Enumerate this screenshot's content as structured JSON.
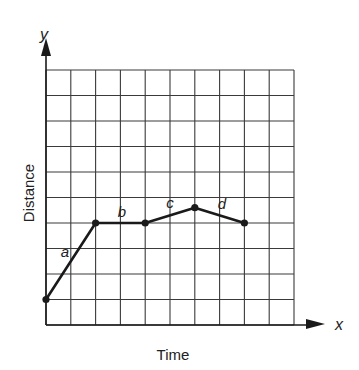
{
  "axes": {
    "x_symbol": "x",
    "y_symbol": "y",
    "x_label": "Time",
    "y_label": "Distance"
  },
  "grid": {
    "columns": 10,
    "rows": 10
  },
  "segment_labels": [
    "a",
    "b",
    "c",
    "d"
  ],
  "chart_data": {
    "type": "line",
    "title": "",
    "xlabel": "Time",
    "ylabel": "Distance",
    "grid": true,
    "xlim": [
      0,
      10
    ],
    "ylim": [
      0,
      10
    ],
    "tick_labels": "none",
    "x": [
      0,
      2,
      4,
      6,
      8
    ],
    "series": [
      {
        "name": "distance-time",
        "values": [
          1,
          4,
          4,
          4.6,
          4
        ]
      }
    ],
    "segments": [
      {
        "label": "a",
        "from": [
          0,
          1
        ],
        "to": [
          2,
          4
        ]
      },
      {
        "label": "b",
        "from": [
          2,
          4
        ],
        "to": [
          4,
          4
        ]
      },
      {
        "label": "c",
        "from": [
          4,
          4
        ],
        "to": [
          6,
          4.6
        ]
      },
      {
        "label": "d",
        "from": [
          6,
          4.6
        ],
        "to": [
          8,
          4
        ]
      }
    ]
  },
  "colors": {
    "line": "#1a1a1a",
    "grid": "#3a3a3a",
    "background": "#ffffff"
  }
}
